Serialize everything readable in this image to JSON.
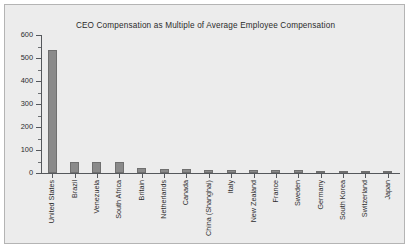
{
  "chart_data": {
    "type": "bar",
    "title": "CEO Compensation as Multiple of Average Employee Compensation",
    "xlabel": "",
    "ylabel": "",
    "ylim": [
      0,
      600
    ],
    "ytick_step": 100,
    "yminor_step": 50,
    "grid": false,
    "legend": "none",
    "orientation": "vertical",
    "bar_color": "#8a8a8a",
    "categories": [
      "United States",
      "Brazil",
      "Venezuela",
      "South Africa",
      "Britain",
      "Netherlands",
      "Canada",
      "China (Shanghai)",
      "Italy",
      "New Zealand",
      "France",
      "Sweden",
      "Germany",
      "South Korea",
      "Switzerland",
      "Japan"
    ],
    "values": [
      535,
      48,
      46,
      46,
      22,
      17,
      17,
      13,
      13,
      13,
      12,
      11,
      9,
      7,
      7,
      5
    ],
    "yticks": [
      0,
      100,
      200,
      300,
      400,
      500,
      600
    ]
  },
  "figure": {
    "background_color": "#ececec",
    "frame_color": "#b4b4b4",
    "axis_color": "#55585c",
    "text_color": "#2b2b2b"
  }
}
